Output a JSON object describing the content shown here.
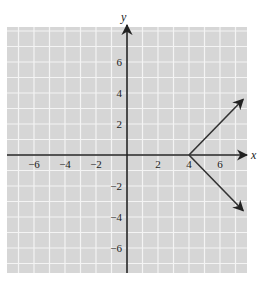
{
  "chart_data": {
    "type": "line",
    "title": "",
    "xlabel": "x",
    "ylabel": "y",
    "xlim": [
      -7.7,
      7.7
    ],
    "ylim": [
      -7.5,
      8.3
    ],
    "grid": true,
    "x_ticks": [
      -6,
      -4,
      -2,
      2,
      4,
      6
    ],
    "y_ticks": [
      6,
      4,
      2,
      -2,
      -4,
      -6
    ],
    "x_tick_labels": [
      "−6",
      "−4",
      "−2",
      "2",
      "4",
      "6"
    ],
    "y_tick_labels": [
      "6",
      "4",
      "2",
      "−2",
      "−4",
      "−6"
    ],
    "series": [
      {
        "name": "upper ray",
        "points": [
          [
            4,
            0
          ],
          [
            7.5,
            3.6
          ]
        ],
        "arrow_end": true
      },
      {
        "name": "lower ray",
        "points": [
          [
            4,
            0
          ],
          [
            7.5,
            -3.6
          ]
        ],
        "arrow_end": true
      }
    ],
    "vertex": [
      4,
      0
    ],
    "colors": {
      "grid_bg": "#d6d6d6",
      "grid_line": "#f4f4f4",
      "axis": "#222222",
      "ray": "#333333"
    }
  }
}
